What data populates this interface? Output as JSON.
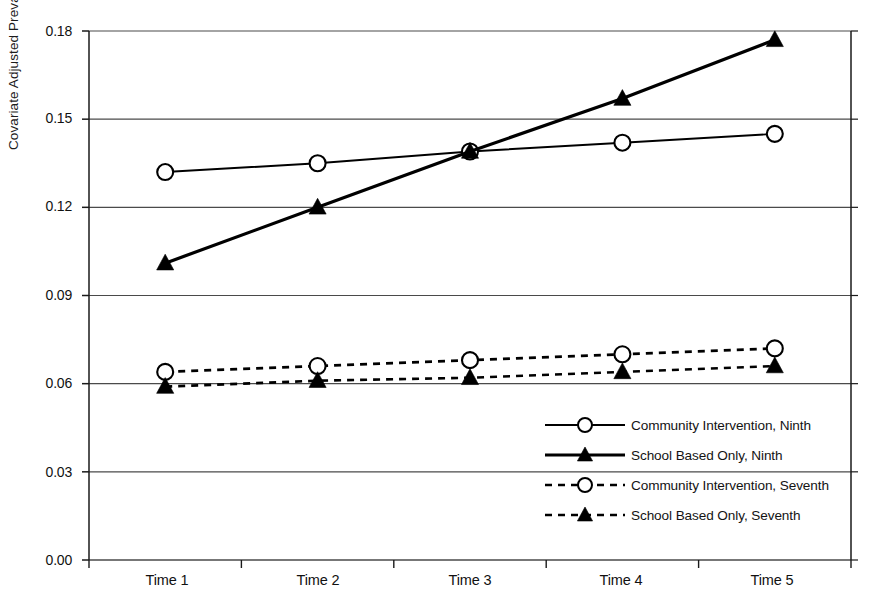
{
  "chart_data": {
    "type": "line",
    "title": "",
    "xlabel": "",
    "ylabel": "Covariate Adjusted Prevalence",
    "categories": [
      "Time 1",
      "Time 2",
      "Time 3",
      "Time 4",
      "Time 5"
    ],
    "ylim": [
      0.0,
      0.18
    ],
    "yticks": [
      "0.00",
      "0.03",
      "0.06",
      "0.09",
      "0.12",
      "0.15",
      "0.18"
    ],
    "ytick_values": [
      0.0,
      0.03,
      0.06,
      0.09,
      0.12,
      0.15,
      0.18
    ],
    "grid": true,
    "grid_axis": "y",
    "legend_position": "inside-lower-right",
    "series": [
      {
        "name": "Community Intervention, Ninth",
        "values": [
          0.132,
          0.135,
          0.139,
          0.142,
          0.145
        ],
        "marker": "open-circle",
        "line_style": "solid",
        "color": "#000000"
      },
      {
        "name": "School Based Only, Ninth",
        "values": [
          0.101,
          0.12,
          0.139,
          0.157,
          0.177
        ],
        "marker": "filled-triangle",
        "line_style": "solid",
        "color": "#000000"
      },
      {
        "name": "Community Intervention, Seventh",
        "values": [
          0.064,
          0.066,
          0.068,
          0.07,
          0.072
        ],
        "marker": "open-circle",
        "line_style": "dashed",
        "color": "#000000"
      },
      {
        "name": "School Based Only, Seventh",
        "values": [
          0.059,
          0.061,
          0.062,
          0.064,
          0.066
        ],
        "marker": "filled-triangle",
        "line_style": "dashed",
        "color": "#000000"
      }
    ]
  },
  "legend": {
    "items": [
      {
        "label": "Community Intervention, Ninth"
      },
      {
        "label": "School Based Only, Ninth"
      },
      {
        "label": "Community Intervention, Seventh"
      },
      {
        "label": "School Based Only, Seventh"
      }
    ]
  },
  "colors": {
    "axis": "#1a1a1a",
    "grid": "#4a4a4a",
    "series": "#000000",
    "background": "#ffffff"
  }
}
